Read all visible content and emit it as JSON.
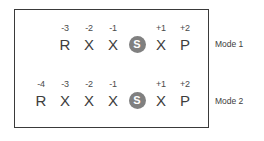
{
  "diagram": {
    "frame_color": "#3a3a3a",
    "marker_color": "#808080",
    "text_color": "#3d3d3d",
    "rows": [
      {
        "caption": "Mode 1",
        "cells": [
          {
            "offset": "-3",
            "token": "R",
            "highlighted": false
          },
          {
            "offset": "-2",
            "token": "X",
            "highlighted": false
          },
          {
            "offset": "-1",
            "token": "X",
            "highlighted": false
          },
          {
            "offset": "",
            "token": "S",
            "highlighted": true
          },
          {
            "offset": "+1",
            "token": "X",
            "highlighted": false
          },
          {
            "offset": "+2",
            "token": "P",
            "highlighted": false
          }
        ]
      },
      {
        "caption": "Mode 2",
        "cells": [
          {
            "offset": "-4",
            "token": "R",
            "highlighted": false
          },
          {
            "offset": "-3",
            "token": "X",
            "highlighted": false
          },
          {
            "offset": "-2",
            "token": "X",
            "highlighted": false
          },
          {
            "offset": "-1",
            "token": "X",
            "highlighted": false
          },
          {
            "offset": "",
            "token": "S",
            "highlighted": true
          },
          {
            "offset": "+1",
            "token": "X",
            "highlighted": false
          },
          {
            "offset": "+2",
            "token": "P",
            "highlighted": false
          }
        ]
      }
    ]
  }
}
